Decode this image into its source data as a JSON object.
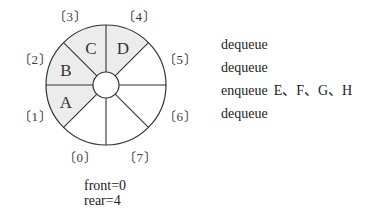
{
  "diagram": {
    "type": "circular-queue",
    "capacity": 8,
    "slot_labels": [
      "〔0〕",
      "〔1〕",
      "〔2〕",
      "〔3〕",
      "〔4〕",
      "〔5〕",
      "〔6〕",
      "〔7〕"
    ],
    "slots": [
      {
        "index": 0,
        "value": ""
      },
      {
        "index": 1,
        "value": "A"
      },
      {
        "index": 2,
        "value": "B"
      },
      {
        "index": 3,
        "value": "C"
      },
      {
        "index": 4,
        "value": "D"
      },
      {
        "index": 5,
        "value": ""
      },
      {
        "index": 6,
        "value": ""
      },
      {
        "index": 7,
        "value": ""
      }
    ],
    "colors": {
      "filled": "#ececec",
      "empty": "#ffffff",
      "stroke": "#333333"
    }
  },
  "status": {
    "front": "front=0",
    "rear": "rear=4"
  },
  "operations": [
    {
      "op": "dequeue",
      "args": ""
    },
    {
      "op": "dequeue",
      "args": ""
    },
    {
      "op": "enqueue",
      "args": "E、F、G、H"
    },
    {
      "op": "dequeue",
      "args": ""
    }
  ]
}
